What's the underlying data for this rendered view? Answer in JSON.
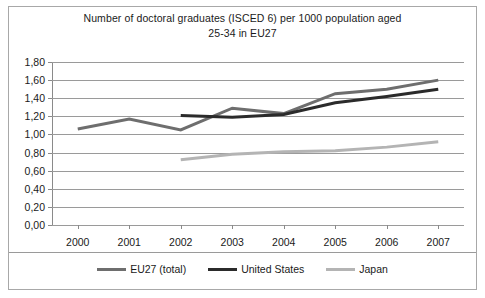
{
  "chart_data": {
    "type": "line",
    "title": "Number of doctoral graduates (ISCED 6) per 1000 population aged 25-34 in EU27",
    "title_line1": "Number of doctoral graduates (ISCED 6) per 1000 population aged",
    "title_line2": "25-34 in EU27",
    "xlabel": "",
    "ylabel": "",
    "x": [
      2000,
      2001,
      2002,
      2003,
      2004,
      2005,
      2006,
      2007
    ],
    "categories": [
      "2000",
      "2001",
      "2002",
      "2003",
      "2004",
      "2005",
      "2006",
      "2007"
    ],
    "ylim": [
      0,
      1.8
    ],
    "ytick_labels": [
      "0,00",
      "0,20",
      "0,40",
      "0,60",
      "0,80",
      "1,00",
      "1,20",
      "1,40",
      "1,60",
      "1,80"
    ],
    "ytick_values": [
      0,
      0.2,
      0.4,
      0.6,
      0.8,
      1.0,
      1.2,
      1.4,
      1.6,
      1.8
    ],
    "grid": true,
    "legend_position": "bottom",
    "decimal_separator": ",",
    "series": [
      {
        "name": "EU27 (total)",
        "color": "#6e6e6e",
        "width": 3,
        "values": [
          1.06,
          1.17,
          1.05,
          1.29,
          1.23,
          1.45,
          1.5,
          1.6
        ]
      },
      {
        "name": "United States",
        "color": "#2b2b2b",
        "width": 3,
        "values": [
          null,
          null,
          1.21,
          1.19,
          1.22,
          1.35,
          1.42,
          1.5
        ]
      },
      {
        "name": "Japan",
        "color": "#b4b4b4",
        "width": 3,
        "values": [
          null,
          null,
          0.72,
          0.78,
          0.81,
          0.82,
          0.86,
          0.92
        ]
      }
    ]
  },
  "legend": {
    "items": [
      {
        "label": "EU27 (total)",
        "color": "#6e6e6e"
      },
      {
        "label": "United States",
        "color": "#2b2b2b"
      },
      {
        "label": "Japan",
        "color": "#b4b4b4"
      }
    ]
  }
}
